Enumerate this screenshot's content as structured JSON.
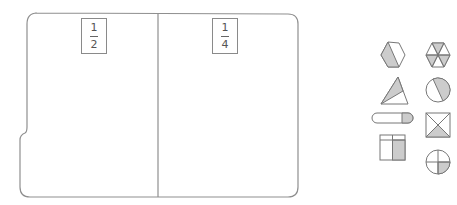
{
  "sorting_mat": {
    "columns": [
      {
        "label_numerator": "1",
        "label_denominator": "2"
      },
      {
        "label_numerator": "1",
        "label_denominator": "4"
      }
    ]
  },
  "shape_cards": [
    {
      "shape": "hexagon",
      "fraction_shaded": "1/2",
      "name": "hexagon-half-shaded"
    },
    {
      "shape": "hexagon",
      "fraction_shaded": "1/2",
      "name": "hexagon-sixths-alternating-shaded"
    },
    {
      "shape": "triangle",
      "fraction_shaded": "1/2",
      "name": "triangle-half-shaded"
    },
    {
      "shape": "circle",
      "fraction_shaded": "1/2",
      "name": "circle-half-shaded"
    },
    {
      "shape": "rounded-bar",
      "fraction_shaded": "1/4",
      "name": "bar-quarter-shaded"
    },
    {
      "shape": "square",
      "fraction_shaded": "1/4",
      "name": "square-diagonal-quarter-shaded"
    },
    {
      "shape": "square",
      "fraction_shaded": "1/2",
      "name": "square-grid-half-shaded"
    },
    {
      "shape": "circle",
      "fraction_shaded": "1/4",
      "name": "circle-quarter-shaded"
    }
  ],
  "colors": {
    "outline": "#777777",
    "shade": "#cccccc",
    "mat_border": "#8f8f8f",
    "background": "#ffffff"
  }
}
